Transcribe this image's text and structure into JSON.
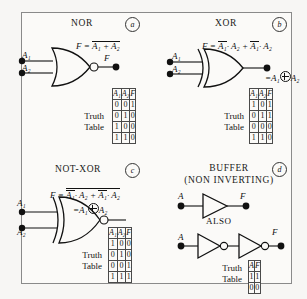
{
  "figure": {
    "background": "#f7f6f4",
    "panel_background": "#fbfaf8",
    "border_color": "#8a8a8a",
    "ink_color": "#111111"
  },
  "panels": [
    {
      "id": "nor",
      "title": "NOR",
      "tag": "a",
      "equation_prefix": "F =",
      "equation_body": "A₁ + A₂",
      "equation_overbar": true,
      "inputs": [
        "A₁",
        "A₂"
      ],
      "output": "F",
      "gate_type": "nor-gate",
      "truth_label_line1": "Truth",
      "truth_label_line2": "Table",
      "table": {
        "headers": [
          "A₁",
          "A₂",
          "F"
        ],
        "rows": [
          [
            "0",
            "0",
            "1"
          ],
          [
            "0",
            "1",
            "0"
          ],
          [
            "1",
            "0",
            "0"
          ],
          [
            "1",
            "1",
            "0"
          ]
        ]
      }
    },
    {
      "id": "xor",
      "title": "XOR",
      "tag": "b",
      "equation_prefix": "F =",
      "equation_term1_bar": "A₁",
      "equation_term1_rest": "· A₂ +",
      "equation_term2_bar": "A₁",
      "equation_term2_rest": "· A₂",
      "alt_equation_prefix": "=",
      "alt_equation_left": "A₁",
      "alt_equation_right": "A₂",
      "alt_equation_operator": "xor-circle-plus",
      "inputs": [
        "A₁",
        "A₂"
      ],
      "output": "",
      "gate_type": "xor-gate",
      "truth_label_line1": "Truth",
      "truth_label_line2": "Table",
      "table": {
        "headers": [
          "A₁",
          "A₂",
          "F"
        ],
        "rows": [
          [
            "1",
            "0",
            "1"
          ],
          [
            "0",
            "1",
            "1"
          ],
          [
            "0",
            "0",
            "0"
          ],
          [
            "1",
            "1",
            "0"
          ]
        ]
      }
    },
    {
      "id": "not-xor",
      "title": "NOT-XOR",
      "tag": "c",
      "equation_prefix": "F =",
      "equation_term1_bar": "A₁",
      "equation_term1_rest": "· A₂ +",
      "equation_term2_bar": "A₁",
      "equation_term2_rest": "· A₂",
      "equation_outer_overbar": true,
      "alt_equation_prefix": "=",
      "alt_equation_left": "A₁",
      "alt_equation_right": "A₂",
      "alt_equation_operator": "xor-circle-plus",
      "inputs": [
        "A₁",
        "A₂"
      ],
      "output": "",
      "gate_type": "xnor-gate",
      "truth_label_line1": "Truth",
      "truth_label_line2": "Table",
      "table": {
        "headers": [
          "A₁",
          "A₂",
          "F"
        ],
        "rows": [
          [
            "1",
            "0",
            "0"
          ],
          [
            "0",
            "1",
            "0"
          ],
          [
            "0",
            "0",
            "1"
          ],
          [
            "1",
            "1",
            "1"
          ]
        ]
      }
    },
    {
      "id": "buffer",
      "title_line1": "BUFFER",
      "title_line2": "(NON INVERTING)",
      "tag": "d",
      "also_label": "ALSO",
      "input_top": "A",
      "output_top": "F",
      "input_bottom": "A",
      "output_bottom": "F",
      "gate_type_top": "buffer-gate",
      "gate_type_bottom": "double-inverter",
      "truth_label_line1": "Truth",
      "truth_label_line2": "Table",
      "table": {
        "headers": [
          "A",
          "F"
        ],
        "rows": [
          [
            "1",
            "1"
          ],
          [
            "0",
            "0"
          ]
        ]
      }
    }
  ]
}
